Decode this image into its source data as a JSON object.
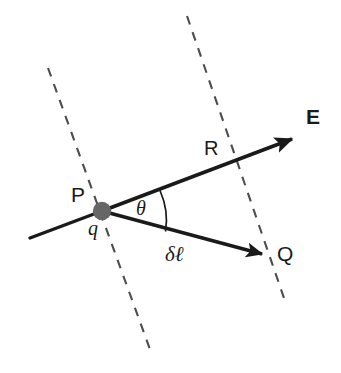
{
  "figure": {
    "background_color": "#ffffff",
    "stroke_color": "#1a1a1a",
    "dashed_color": "#4d4d4d",
    "charge_dot_color": "#666666",
    "labels": {
      "field_vector": "E",
      "distance_R": "R",
      "point_P": "P",
      "charge_q": "q",
      "angle_theta": "θ",
      "displacement": "δℓ",
      "point_Q": "Q"
    },
    "elements": {
      "charge_dot": {
        "name": "charge-dot-P",
        "cx": 102,
        "cy": 211,
        "r": 9
      },
      "ray_E": {
        "name": "field-line-E",
        "from": [
          30,
          238
        ],
        "vertex": [
          102,
          211
        ],
        "to": [
          298,
          137
        ],
        "arrow": "tip"
      },
      "ray_Q": {
        "name": "displacement-line-PQ",
        "from": [
          102,
          211
        ],
        "to": [
          268,
          256
        ],
        "arrow": "tip"
      },
      "dashed_left": {
        "name": "equipotential-line-left",
        "from": [
          48,
          68
        ],
        "to": [
          152,
          355
        ]
      },
      "dashed_right": {
        "name": "equipotential-line-right",
        "from": [
          187,
          16
        ],
        "to": [
          284,
          298
        ]
      },
      "angle_arc": {
        "name": "angle-arc-theta",
        "from": [
          160,
          191
        ],
        "to": [
          166,
          231
        ]
      }
    }
  }
}
